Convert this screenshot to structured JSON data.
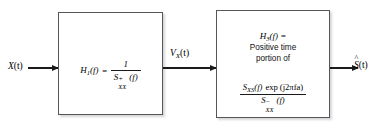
{
  "diagram": {
    "line_color": "#1a1a1a",
    "block_border_color": "#55555a",
    "background": "#ffffff"
  },
  "signals": {
    "input": {
      "base": "X",
      "arg": "(t)"
    },
    "intermediate": {
      "base": "V",
      "sub": "X",
      "arg": "(t)"
    },
    "output": {
      "base": "S",
      "hat": "^",
      "arg": "(t)"
    }
  },
  "blocks": [
    {
      "id": "h1",
      "name": "whitening-filter",
      "transfer_label": {
        "base": "H",
        "sub": "1",
        "arg": "(f)"
      },
      "equals": "=",
      "fraction": {
        "numerator": "1",
        "denominator": {
          "base": "S",
          "sup": "+",
          "sub": "XX",
          "arg": "(f)"
        }
      }
    },
    {
      "id": "h3",
      "name": "causal-part-filter",
      "transfer_label": {
        "base": "H",
        "sub": "3",
        "arg": "(f)"
      },
      "equals": "=",
      "description_line1": "Positive time",
      "description_line2": "portion of",
      "fraction": {
        "numerator": {
          "base": "S",
          "sub": "XS",
          "arg": "(f)",
          "factor": "exp",
          "factor_arg": "(j2πfa)"
        },
        "denominator": {
          "base": "S",
          "sup": "−",
          "sub": "XX",
          "arg": "(f)"
        }
      }
    }
  ],
  "arrows": [
    {
      "name": "input-arrow"
    },
    {
      "name": "intermediate-arrow"
    },
    {
      "name": "output-arrow"
    }
  ]
}
